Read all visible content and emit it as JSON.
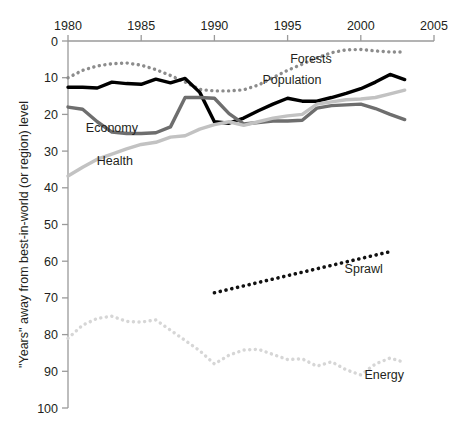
{
  "chart_data": {
    "type": "line",
    "title": "",
    "subtitle": "",
    "xlabel": "",
    "ylabel": "\"Years\" away from best-in-world (or region) level",
    "xlim": [
      1980,
      2005
    ],
    "ylim": [
      0,
      100
    ],
    "y_inverted": true,
    "x_axis_position": "top",
    "grid": false,
    "legend": "inline-labels",
    "xticks": [
      1980,
      1985,
      1990,
      1995,
      2000,
      2005
    ],
    "xtick_labels": [
      "1980",
      "1985",
      "1990",
      "1995",
      "2000",
      "2005"
    ],
    "yticks": [
      0,
      10,
      20,
      30,
      40,
      50,
      60,
      70,
      80,
      90,
      100
    ],
    "ytick_labels": [
      "0",
      "10",
      "20",
      "30",
      "40",
      "50",
      "60",
      "70",
      "80",
      "90",
      "100"
    ],
    "series": [
      {
        "name": "Forests",
        "label": "Forests",
        "color": "#8c8c8c",
        "style": "dotted",
        "width": 3.4,
        "label_x": 1996.6,
        "label_y": 4.9,
        "x": [
          1980,
          1981,
          1982,
          1983,
          1984,
          1985,
          1986,
          1987,
          1988,
          1989,
          1990,
          1991,
          1992,
          1993,
          1994,
          1995,
          1996,
          1997,
          1998,
          1999,
          2000,
          2001,
          2002,
          2003
        ],
        "values": [
          10.0,
          8.0,
          6.8,
          6.2,
          6.0,
          6.6,
          7.8,
          9.4,
          11.2,
          13.2,
          13.6,
          13.6,
          13.3,
          12.0,
          10.0,
          8.0,
          6.3,
          4.6,
          3.2,
          2.4,
          2.3,
          2.7,
          3.0,
          3.0
        ]
      },
      {
        "name": "Population",
        "label": "Population",
        "color": "#000000",
        "style": "solid",
        "width": 3.4,
        "label_x": 1995.3,
        "label_y": 10.6,
        "x": [
          1980,
          1981,
          1982,
          1983,
          1984,
          1985,
          1986,
          1987,
          1988,
          1989,
          1990,
          1991,
          1992,
          1993,
          1994,
          1995,
          1996,
          1997,
          1998,
          1999,
          2000,
          2001,
          2002,
          2003
        ],
        "values": [
          12.6,
          12.6,
          12.8,
          11.2,
          11.6,
          11.8,
          10.4,
          11.4,
          10.2,
          14.0,
          22.0,
          22.4,
          21.0,
          19.0,
          17.2,
          15.6,
          16.4,
          16.4,
          15.4,
          14.3,
          13.0,
          11.2,
          9.1,
          10.5
        ]
      },
      {
        "name": "Economy",
        "label": "Economy",
        "color": "#6e6e6e",
        "style": "solid",
        "width": 3.4,
        "label_x": 1983.0,
        "label_y": 23.6,
        "x": [
          1980,
          1981,
          1982,
          1983,
          1984,
          1985,
          1986,
          1987,
          1988,
          1989,
          1990,
          1991,
          1992,
          1993,
          1994,
          1995,
          1996,
          1997,
          1998,
          1999,
          2000,
          2001,
          2002,
          2003
        ],
        "values": [
          18.0,
          18.6,
          22.0,
          24.8,
          25.2,
          25.2,
          25.0,
          23.4,
          15.4,
          15.4,
          15.6,
          19.8,
          22.6,
          22.2,
          21.8,
          21.8,
          21.6,
          18.3,
          17.6,
          17.4,
          17.2,
          18.4,
          20.0,
          21.4
        ]
      },
      {
        "name": "Health",
        "label": "Health",
        "color": "#c2c2c2",
        "style": "solid",
        "width": 3.4,
        "label_x": 1983.2,
        "label_y": 32.6,
        "x": [
          1980,
          1981,
          1982,
          1983,
          1984,
          1985,
          1986,
          1987,
          1988,
          1989,
          1990,
          1991,
          1992,
          1993,
          1994,
          1995,
          1996,
          1997,
          1998,
          1999,
          2000,
          2001,
          2002,
          2003
        ],
        "values": [
          36.8,
          34.4,
          32.2,
          30.8,
          29.4,
          28.2,
          27.6,
          26.2,
          25.8,
          24.0,
          22.8,
          22.0,
          23.0,
          22.0,
          21.0,
          20.4,
          20.0,
          17.2,
          16.6,
          16.0,
          15.8,
          15.4,
          14.4,
          13.4
        ]
      },
      {
        "name": "Sprawl",
        "label": "Sprawl",
        "color": "#111111",
        "style": "dotted",
        "width": 3.6,
        "label_x": 2000.2,
        "label_y": 62.0,
        "x": [
          1990,
          2002
        ],
        "values": [
          68.6,
          57.4
        ]
      },
      {
        "name": "Energy",
        "label": "Energy",
        "color": "#d6d6d6",
        "style": "dotted",
        "width": 3.4,
        "label_x": 2001.6,
        "label_y": 90.8,
        "x": [
          1980,
          1981,
          1982,
          1983,
          1984,
          1985,
          1986,
          1987,
          1988,
          1989,
          1990,
          1991,
          1992,
          1993,
          1994,
          1995,
          1996,
          1997,
          1998,
          1999,
          2000,
          2001,
          2002,
          2003
        ],
        "values": [
          81.0,
          77.4,
          75.6,
          75.0,
          76.4,
          76.6,
          76.0,
          78.8,
          81.6,
          84.4,
          88.0,
          85.6,
          84.2,
          84.0,
          85.4,
          86.8,
          86.6,
          88.6,
          87.4,
          89.6,
          91.0,
          88.0,
          86.4,
          87.6
        ]
      }
    ]
  }
}
